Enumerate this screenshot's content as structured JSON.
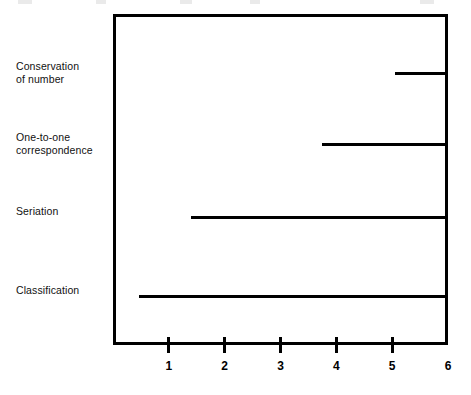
{
  "chart_data": {
    "type": "bar",
    "orientation": "horizontal",
    "title": "",
    "subtitle": "",
    "xlabel": "",
    "ylabel": "",
    "xlim": [
      0,
      6
    ],
    "ylim": [
      0,
      4
    ],
    "grid": false,
    "legend": null,
    "note": "Horizontal range lines: each category line spans from its start value to 6 (right edge of plot box).",
    "categories": [
      "Conservation of number",
      "One-to-one correspondence",
      "Seriation",
      "Classification"
    ],
    "category_labels_multiline": [
      "Conservation\nof number",
      "One-to-one\ncorrespondence",
      "Seriation",
      "Classification"
    ],
    "bars": [
      {
        "category": "Conservation of number",
        "start": 5.05,
        "end": 6,
        "value": 0.95
      },
      {
        "category": "One-to-one correspondence",
        "start": 3.75,
        "end": 6,
        "value": 2.25
      },
      {
        "category": "Seriation",
        "start": 1.4,
        "end": 6,
        "value": 4.6
      },
      {
        "category": "Classification",
        "start": 0.47,
        "end": 6,
        "value": 5.53
      }
    ],
    "start_values": [
      5.05,
      3.75,
      1.4,
      0.47
    ],
    "end_values": [
      6,
      6,
      6,
      6
    ],
    "xticks": [
      1,
      2,
      3,
      4,
      5,
      6
    ],
    "xtick_labels": [
      "1",
      "2",
      "3",
      "4",
      "5",
      "6"
    ],
    "colors": {
      "bar": "#000000",
      "axis": "#000000",
      "background": "#ffffff",
      "label_text": "#111111"
    }
  },
  "axis": {
    "ticks": [
      {
        "label": "1",
        "value": 1
      },
      {
        "label": "2",
        "value": 2
      },
      {
        "label": "3",
        "value": 3
      },
      {
        "label": "4",
        "value": 4
      },
      {
        "label": "5",
        "value": 5
      },
      {
        "label": "6",
        "value": 6
      }
    ]
  }
}
